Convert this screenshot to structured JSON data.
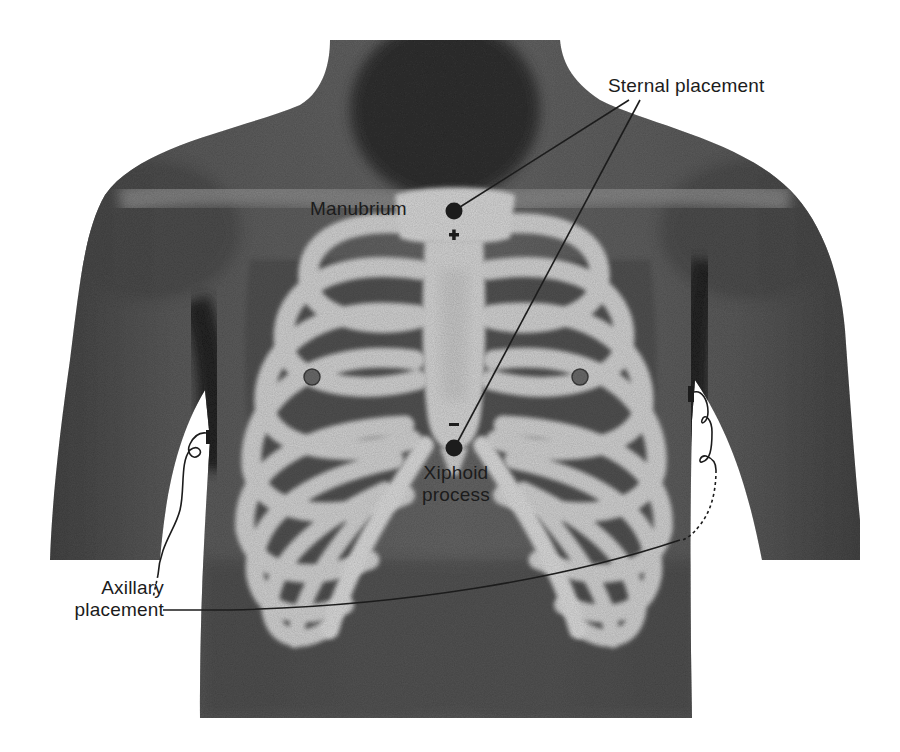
{
  "figure": {
    "colors": {
      "background": "#ffffff",
      "skin_dark": "#3a3a3a",
      "skin_mid": "#5e5e5e",
      "skin_light": "#7a7a7a",
      "bone": "#c9c9c9",
      "bone_highlight": "#dedede",
      "ink": "#1c1c1c"
    }
  },
  "labels": {
    "sternal_placement": "Sternal placement",
    "manubrium": "Manubrium",
    "xiphoid_line1": "Xiphoid",
    "xiphoid_line2": "process",
    "axillary_line1": "Axillary",
    "axillary_line2": "placement"
  },
  "electrodes": [
    {
      "name": "manubrium-electrode",
      "site": "Manubrium",
      "polarity": "+",
      "x": 454,
      "y": 211
    },
    {
      "name": "xiphoid-electrode",
      "site": "Xiphoid process",
      "polarity": "−",
      "x": 454,
      "y": 448
    },
    {
      "name": "right-axillary-electrode",
      "site": "Right axilla",
      "x": 207,
      "y": 440
    },
    {
      "name": "left-axillary-electrode",
      "site": "Left axilla",
      "x": 691,
      "y": 400
    }
  ],
  "polarity_marks": {
    "plus": "+",
    "minus": "−"
  }
}
